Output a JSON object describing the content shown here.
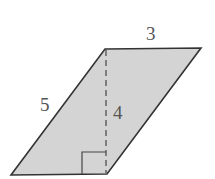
{
  "diagram": {
    "shape": "parallelogram",
    "fill_color": "#d4d4d4",
    "stroke_color": "#333333",
    "labels": {
      "top_side": "3",
      "left_side": "5",
      "height": "4"
    },
    "vertices": {
      "top_left": [
        105,
        49
      ],
      "top_right": [
        201,
        48
      ],
      "bottom_right": [
        107,
        174
      ],
      "bottom_left": [
        11,
        175
      ]
    },
    "height_line": "dashed",
    "right_angle_marker": true
  }
}
